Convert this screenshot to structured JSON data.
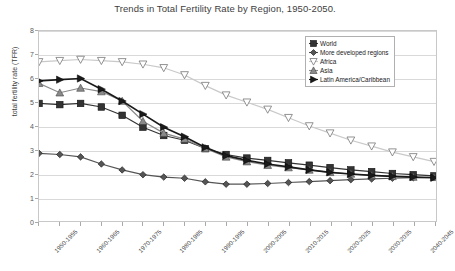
{
  "chart_data": {
    "type": "line",
    "title": "Trends in Total Fertility Rate by Region, 1950-2050.",
    "xlabel": "",
    "ylabel": "total fertility rate (TFR)",
    "ylim": [
      0,
      8
    ],
    "ytick_labels": [
      "0",
      "1",
      "2",
      "3",
      "4",
      "5",
      "6",
      "7",
      "8"
    ],
    "ytick_values": [
      0,
      1,
      2,
      3,
      4,
      5,
      6,
      7,
      8
    ],
    "grid": true,
    "legend_position": "upper-right",
    "categories": [
      "1950-1955",
      "1955-1960",
      "1960-1965",
      "1965-1970",
      "1970-1975",
      "1975-1980",
      "1980-1985",
      "1985-1990",
      "1990-1995",
      "1995-2000",
      "2000-2005",
      "2005-2010",
      "2010-2015",
      "2015-2020",
      "2020-2025",
      "2025-2030",
      "2030-2035",
      "2035-2040",
      "2040-2045",
      "2045-2050"
    ],
    "xtick_labels_shown": [
      "1950-1955",
      "1960-1965",
      "1970-1975",
      "1980-1985",
      "1990-1995",
      "2000-2005",
      "2010-2015",
      "2020-2025",
      "2030-2035",
      "2040-2045"
    ],
    "series": [
      {
        "name": "World",
        "marker": "square",
        "color": "#333333",
        "values": [
          4.95,
          4.9,
          4.95,
          4.8,
          4.45,
          3.95,
          3.6,
          3.4,
          3.05,
          2.8,
          2.65,
          2.55,
          2.45,
          2.35,
          2.25,
          2.15,
          2.08,
          2.0,
          1.95,
          1.9
        ]
      },
      {
        "name": "More developed regions",
        "marker": "diamond",
        "color": "#555555",
        "values": [
          2.85,
          2.8,
          2.7,
          2.4,
          2.15,
          1.95,
          1.85,
          1.8,
          1.65,
          1.55,
          1.55,
          1.58,
          1.62,
          1.66,
          1.7,
          1.74,
          1.77,
          1.8,
          1.82,
          1.84
        ]
      },
      {
        "name": "Africa",
        "marker": "triangle-down",
        "color": "#c9c9c9",
        "values": [
          6.7,
          6.75,
          6.8,
          6.75,
          6.7,
          6.6,
          6.45,
          6.15,
          5.7,
          5.3,
          5.0,
          4.7,
          4.35,
          4.0,
          3.7,
          3.4,
          3.15,
          2.9,
          2.7,
          2.5
        ]
      },
      {
        "name": "Asia",
        "marker": "triangle-up",
        "color": "#8a8a8a",
        "values": [
          5.8,
          5.4,
          5.6,
          5.45,
          5.05,
          4.2,
          3.7,
          3.45,
          3.05,
          2.7,
          2.5,
          2.35,
          2.25,
          2.15,
          2.05,
          1.98,
          1.92,
          1.88,
          1.85,
          1.84
        ]
      },
      {
        "name": "Latin America/Caribbean",
        "marker": "triangle-right",
        "color": "#1a1a1a",
        "values": [
          5.9,
          5.95,
          6.0,
          5.55,
          5.05,
          4.5,
          3.95,
          3.55,
          3.1,
          2.75,
          2.55,
          2.4,
          2.28,
          2.15,
          2.05,
          1.98,
          1.92,
          1.88,
          1.85,
          1.82
        ]
      }
    ]
  }
}
